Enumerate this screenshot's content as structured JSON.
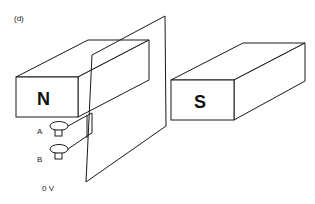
{
  "figure": {
    "panel_label": "(d)",
    "magnets": {
      "north": {
        "label": "N"
      },
      "south": {
        "label": "S"
      }
    },
    "terminals": [
      {
        "label": "A"
      },
      {
        "label": "B"
      }
    ],
    "voltage_label": "0 V"
  },
  "colors": {
    "stroke": "#1a1a1a",
    "background": "#ffffff"
  }
}
